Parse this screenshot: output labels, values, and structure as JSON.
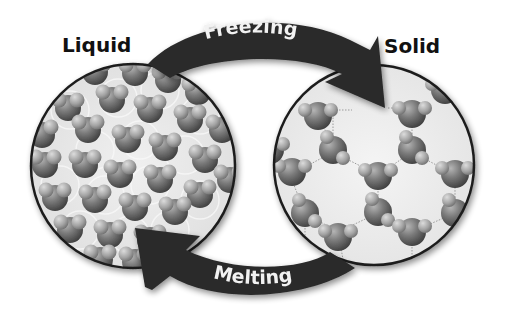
{
  "diagram": {
    "states": [
      {
        "label": "Liquid",
        "description": "Water molecules randomly packed"
      },
      {
        "label": "Solid",
        "description": "Water molecules in hexagonal lattice"
      }
    ],
    "transitions": [
      {
        "label": "Freezing",
        "from": "Liquid",
        "to": "Solid"
      },
      {
        "label": "Melting",
        "from": "Solid",
        "to": "Liquid"
      }
    ]
  },
  "colors": {
    "arrow": "#2a2a2a",
    "arrow_text": "#f2f2f2",
    "circle_border": "#1e1e1e",
    "circle_bg": "#ececec",
    "molecule_oxygen": "#6e6e6e",
    "molecule_hydrogen": "#a8a8a8"
  }
}
